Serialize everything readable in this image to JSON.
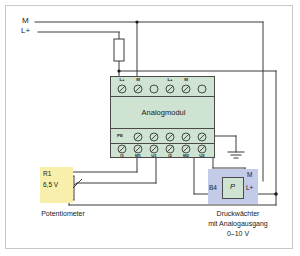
{
  "diagram": {
    "colors": {
      "module_fill": "#cfe3d2",
      "module_stroke": "#4a4a4a",
      "pot_fill": "#f7efab",
      "sensor_fill": "#c3cbe8",
      "wire": "#3a3a3a",
      "frame": "#c8c8c8",
      "background": "#ffffff"
    },
    "power_rails": [
      {
        "name": "rail-m",
        "label": "M"
      },
      {
        "name": "rail-lplus",
        "label": "L+"
      }
    ],
    "fuse": {
      "label": ""
    },
    "module": {
      "name": "Analogmodul",
      "title": "Analogmodul",
      "top_terminals": [
        "L+",
        "M",
        "",
        "L+",
        "M",
        ""
      ],
      "pe_row_label": "PE",
      "pe_terminal_count": 5,
      "bottom_terminals": [
        "I1",
        "M1",
        "U1",
        "I2",
        "M2",
        "U2"
      ]
    },
    "potentiometer": {
      "designator": "R1",
      "value": "6,5 V",
      "caption": "Potentiometer"
    },
    "pressure_switch": {
      "designator": "B4",
      "symbol": "P",
      "terminal_lplus": "L+",
      "terminal_m": "M",
      "caption_line1": "Druckwächter",
      "caption_line2": "mit Analogausgang",
      "caption_line3": "0–10 V"
    },
    "ground": {
      "label": ""
    }
  }
}
